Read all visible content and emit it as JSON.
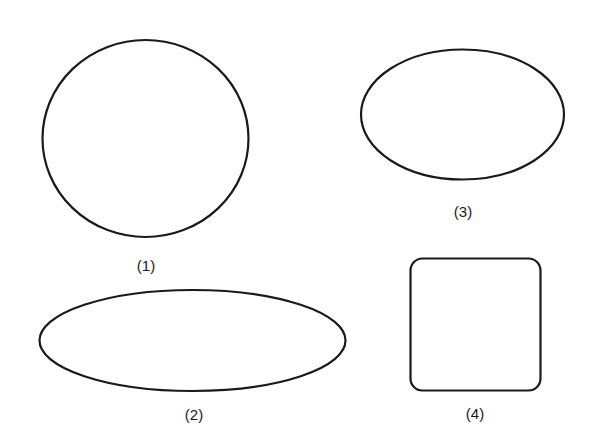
{
  "figure": {
    "background": "#ffffff",
    "stroke_color": "#1a1a1a",
    "shapes": [
      {
        "id": 1,
        "type": "circle",
        "label": "(1)"
      },
      {
        "id": 2,
        "type": "ellipse-wide",
        "label": "(2)"
      },
      {
        "id": 3,
        "type": "ellipse",
        "label": "(3)"
      },
      {
        "id": 4,
        "type": "rounded-square",
        "label": "(4)"
      }
    ]
  }
}
